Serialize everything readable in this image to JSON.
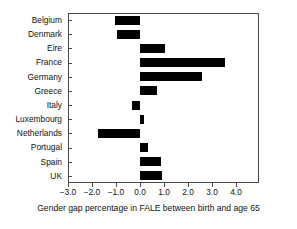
{
  "chart_data": {
    "type": "bar",
    "orientation": "horizontal",
    "title": "",
    "xlabel": "Gender gap percentage in FALE between birth and age 65",
    "ylabel": "",
    "categories": [
      "Belgium",
      "Denmark",
      "Eire",
      "France",
      "Germany",
      "Greece",
      "Italy",
      "Luxembourg",
      "Netherlands",
      "Portugal",
      "Spain",
      "UK"
    ],
    "values": [
      -1.05,
      -0.95,
      1.05,
      3.55,
      2.6,
      0.7,
      -0.35,
      0.15,
      -1.75,
      0.35,
      0.88,
      0.9
    ],
    "xlim": [
      -3.0,
      4.0
    ],
    "xticks": [
      -3.0,
      -2.0,
      -1.0,
      0.0,
      1.0,
      2.0,
      3.0,
      4.0
    ],
    "xticklabels": [
      "−3.0",
      "−2.0",
      "−1.0",
      "0.0",
      "1.0",
      "2.0",
      "3.0",
      "4.0"
    ],
    "grid": false,
    "legend": null,
    "bar_color": "#000000",
    "frame_color": "#4a4a4a",
    "background": "#ffffff"
  },
  "axis": {
    "x_title": "Gender gap percentage in FALE between birth and age 65"
  }
}
